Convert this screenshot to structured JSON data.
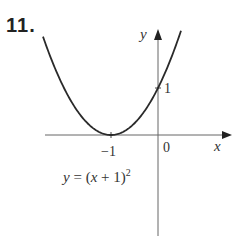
{
  "problem_number": "11.",
  "chart_data": {
    "type": "line",
    "title": "",
    "equation": "y = (x + 1)^2",
    "equation_label": "y = (x + 1)",
    "equation_exponent": "2",
    "xlabel": "x",
    "ylabel": "y",
    "x_ticks": [
      {
        "value": -1,
        "label": "−1"
      },
      {
        "value": 0,
        "label": "0"
      }
    ],
    "y_ticks": [
      {
        "value": 1,
        "label": "1"
      }
    ],
    "vertex": [
      -1,
      0
    ],
    "y_intercept": [
      0,
      1
    ],
    "x": [
      -3.0,
      -2.5,
      -2.0,
      -1.5,
      -1.0,
      -0.5,
      0.0,
      0.5,
      0.75
    ],
    "y": [
      4.0,
      2.25,
      1.0,
      0.25,
      0.0,
      0.25,
      1.0,
      2.25,
      3.06
    ],
    "grid": false,
    "legend": null
  },
  "colors": {
    "curve": "#2a2a2a",
    "axes": "#555555",
    "text": "#333333"
  }
}
